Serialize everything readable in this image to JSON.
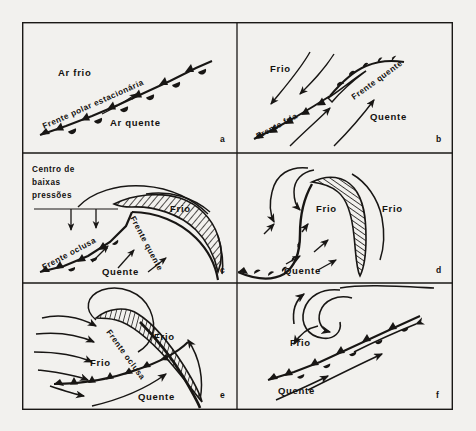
{
  "figure": {
    "background_color": "#f2f1ee",
    "ink_color": "#181614",
    "grid": {
      "columns": 2,
      "rows": 3
    }
  },
  "panels": [
    {
      "id": "a",
      "letter": "a",
      "stage": "frente-polar-estacionaria",
      "labels": {
        "cold_air": "Ar frio",
        "front": "Frente polar estacionária",
        "warm_air": "Ar quente"
      }
    },
    {
      "id": "b",
      "letter": "b",
      "stage": "onda-frontal-incipiente",
      "labels": {
        "cold": "Frio",
        "warm_front": "Frente quente",
        "cold_front": "Frente fria",
        "warm": "Quente"
      }
    },
    {
      "id": "c",
      "letter": "c",
      "stage": "ciclone-maduro-com-oclusao",
      "labels": {
        "low_center": "Centro de baixas pressões",
        "low_center_line1": "Centro de",
        "low_center_line2": "baixas",
        "low_center_line3": "pressões",
        "cold": "Frio",
        "warm_front": "Frente quente",
        "occluded_front": "Frente oclusa",
        "warm": "Quente"
      }
    },
    {
      "id": "d",
      "letter": "d",
      "stage": "oclusao-avancada",
      "labels": {
        "cold_left": "Frio",
        "cold_right": "Frio",
        "warm": "Quente"
      }
    },
    {
      "id": "e",
      "letter": "e",
      "stage": "ciclone-ocluso",
      "labels": {
        "cold_upper": "Frio",
        "cold_lower": "Frio",
        "occluded_front": "Frente oclusa",
        "warm": "Quente"
      }
    },
    {
      "id": "f",
      "letter": "f",
      "stage": "dissipacao-frente-estacionaria",
      "labels": {
        "cold": "Frio",
        "warm": "Quente"
      }
    }
  ]
}
